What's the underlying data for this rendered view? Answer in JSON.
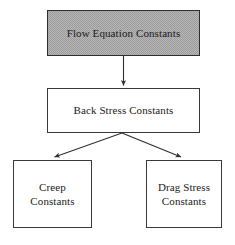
{
  "diagram": {
    "type": "flowchart-hierarchy",
    "background_color": "#ffffff",
    "line_color": "#2e2e2e",
    "text_color": "#1a1a1a",
    "highlight_fill_color": "#b6b6b6",
    "nodes": [
      {
        "id": "flow-equation",
        "label": "Flow Equation Constants",
        "shape": "rectangle",
        "fill": "hatched-gray",
        "level": 0
      },
      {
        "id": "back-stress",
        "label": "Back Stress Constants",
        "shape": "rectangle",
        "fill": "white",
        "level": 1
      },
      {
        "id": "creep",
        "label": "Creep\nConstants",
        "shape": "rectangle",
        "fill": "white",
        "level": 2
      },
      {
        "id": "drag-stress",
        "label": "Drag Stress\nConstants",
        "shape": "rectangle",
        "fill": "white",
        "level": 2
      }
    ],
    "edges": [
      {
        "id": "edge-flow-to-back",
        "from": "flow-equation",
        "to": "back-stress",
        "style": "solid-arrow"
      },
      {
        "id": "edge-back-to-creep",
        "from": "back-stress",
        "to": "creep",
        "style": "solid-arrow"
      },
      {
        "id": "edge-back-to-drag",
        "from": "back-stress",
        "to": "drag-stress",
        "style": "solid-arrow"
      }
    ]
  }
}
